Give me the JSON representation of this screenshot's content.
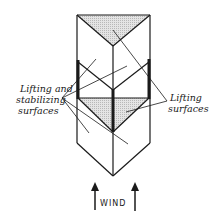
{
  "diagram": {
    "type": "kite-structure-illustration",
    "labels": {
      "left": {
        "line1": "Lifting and",
        "line2": "stabilizing",
        "line3": "surfaces"
      },
      "right": {
        "line1": "Lifting",
        "line2": "surfaces"
      },
      "wind": "WIND"
    },
    "colors": {
      "stroke": "#1a1a1a",
      "shaded_surface": "#d9d9d9",
      "background": "#ffffff"
    },
    "icons": {
      "wind_arrows": "up-arrow-icon"
    }
  }
}
